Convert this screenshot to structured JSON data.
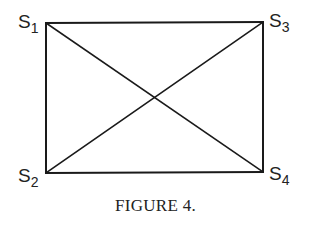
{
  "figure": {
    "caption": "FIGURE 4.",
    "nodes": [
      {
        "id": "S1",
        "base": "S",
        "sub": "1",
        "x": 46,
        "y": 23
      },
      {
        "id": "S2",
        "base": "S",
        "sub": "2",
        "x": 46,
        "y": 173
      },
      {
        "id": "S3",
        "base": "S",
        "sub": "3",
        "x": 263,
        "y": 22
      },
      {
        "id": "S4",
        "base": "S",
        "sub": "4",
        "x": 263,
        "y": 172
      }
    ],
    "edges": [
      [
        "S1",
        "S3"
      ],
      [
        "S1",
        "S2"
      ],
      [
        "S3",
        "S4"
      ],
      [
        "S2",
        "S4"
      ],
      [
        "S1",
        "S4"
      ],
      [
        "S2",
        "S3"
      ]
    ],
    "line_color": "#1a1a1a",
    "text_color": "#222222"
  }
}
